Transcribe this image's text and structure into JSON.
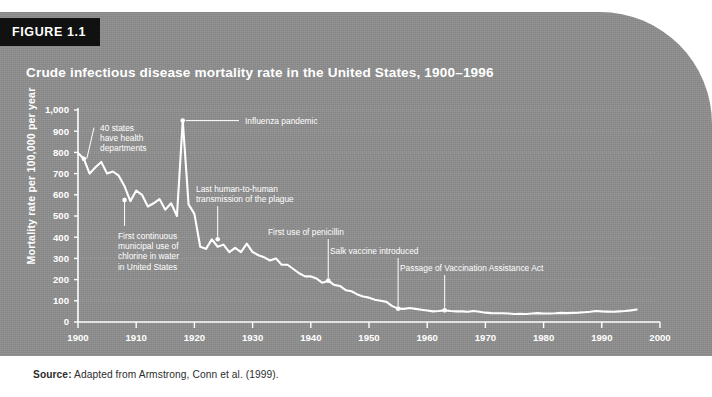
{
  "figure": {
    "badge": "FIGURE 1.1",
    "title": "Crude infectious disease mortality rate in the United States, 1900–1996",
    "source_prefix": "Source:",
    "source_text": " Adapted from Armstrong, Conn et al. (1999)."
  },
  "colors": {
    "panel": "#8d8d8d",
    "badge": "#111111",
    "line": "#ffffff",
    "grid": "#b0b0b0",
    "axis": "#ffffff",
    "text": "#ffffff"
  },
  "chart_data": {
    "type": "line",
    "title": "Crude infectious disease mortality rate in the United States, 1900–1996",
    "xlabel": "",
    "ylabel": "Mortality rate per 100,000 per year",
    "xlim": [
      1900,
      2000
    ],
    "ylim": [
      0,
      1000
    ],
    "xticks": [
      1900,
      1910,
      1920,
      1930,
      1940,
      1950,
      1960,
      1970,
      1980,
      1990,
      2000
    ],
    "xtick_labels": [
      "1900",
      "1910",
      "1920",
      "1930",
      "1940",
      "1950",
      "1960",
      "1970",
      "1980",
      "1990",
      "2000"
    ],
    "yticks": [
      0,
      100,
      200,
      300,
      400,
      500,
      600,
      700,
      800,
      900,
      1000
    ],
    "ytick_labels": [
      "0",
      "100",
      "200",
      "300",
      "400",
      "500",
      "600",
      "700",
      "800",
      "900",
      "1,000"
    ],
    "grid": "horizontal-dotted",
    "legend": "none",
    "series": [
      {
        "name": "Crude infectious disease mortality rate",
        "x": [
          1900,
          1901,
          1902,
          1903,
          1904,
          1905,
          1906,
          1907,
          1908,
          1909,
          1910,
          1911,
          1912,
          1913,
          1914,
          1915,
          1916,
          1917,
          1918,
          1919,
          1920,
          1921,
          1922,
          1923,
          1924,
          1925,
          1926,
          1927,
          1928,
          1929,
          1930,
          1931,
          1932,
          1933,
          1934,
          1935,
          1936,
          1937,
          1938,
          1939,
          1940,
          1941,
          1942,
          1943,
          1944,
          1945,
          1946,
          1947,
          1948,
          1949,
          1950,
          1951,
          1952,
          1953,
          1954,
          1955,
          1956,
          1957,
          1958,
          1959,
          1960,
          1961,
          1962,
          1963,
          1964,
          1965,
          1966,
          1967,
          1968,
          1969,
          1970,
          1971,
          1972,
          1973,
          1974,
          1975,
          1976,
          1977,
          1978,
          1979,
          1980,
          1981,
          1982,
          1983,
          1984,
          1985,
          1986,
          1987,
          1988,
          1989,
          1990,
          1991,
          1992,
          1993,
          1994,
          1995,
          1996
        ],
        "y": [
          797,
          770,
          700,
          730,
          755,
          700,
          710,
          690,
          640,
          570,
          620,
          600,
          545,
          560,
          580,
          530,
          560,
          500,
          950,
          555,
          510,
          355,
          345,
          390,
          355,
          365,
          330,
          350,
          330,
          370,
          330,
          315,
          305,
          290,
          300,
          270,
          270,
          250,
          230,
          215,
          215,
          205,
          185,
          195,
          175,
          170,
          150,
          145,
          130,
          120,
          115,
          105,
          100,
          95,
          75,
          63,
          62,
          66,
          62,
          58,
          54,
          50,
          52,
          55,
          52,
          50,
          50,
          48,
          52,
          48,
          44,
          42,
          41,
          41,
          40,
          38,
          39,
          38,
          40,
          42,
          40,
          40,
          41,
          43,
          42,
          43,
          44,
          46,
          48,
          52,
          50,
          49,
          48,
          50,
          52,
          55,
          59
        ]
      }
    ],
    "annotations": [
      {
        "text": "40 states have health departments",
        "lines": [
          "40 states",
          "have health",
          "departments"
        ],
        "point_x": 1901,
        "point_y": 770
      },
      {
        "text": "Influenza pandemic",
        "lines": [
          "Influenza pandemic"
        ],
        "point_x": 1918,
        "point_y": 950
      },
      {
        "text": "First continuous municipal use of chlorine in water in United States",
        "lines": [
          "First continuous",
          "municipal use of",
          "chlorine in water",
          "in United States"
        ],
        "point_x": 1908,
        "point_y": 575
      },
      {
        "text": "Last human-to-human transmission of the plague",
        "lines": [
          "Last human-to-human",
          "transmission of the plague"
        ],
        "point_x": 1924,
        "point_y": 390
      },
      {
        "text": "First use of penicillin",
        "lines": [
          "First use of penicillin"
        ],
        "point_x": 1943,
        "point_y": 195
      },
      {
        "text": "Salk vaccine introduced",
        "lines": [
          "Salk vaccine introduced"
        ],
        "point_x": 1955,
        "point_y": 63
      },
      {
        "text": "Passage of Vaccination Assistance Act",
        "lines": [
          "Passage of Vaccination Assistance Act"
        ],
        "point_x": 1963,
        "point_y": 55
      }
    ]
  }
}
